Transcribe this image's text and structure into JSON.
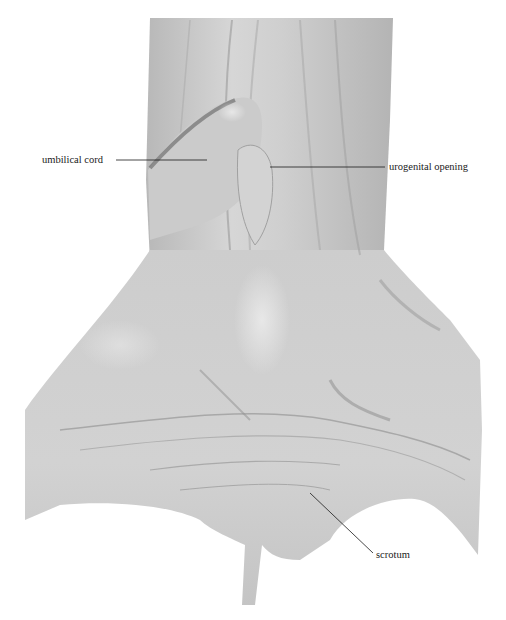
{
  "figure": {
    "background": "#ffffff",
    "specimen_tone": "#c9c9c9",
    "labels": [
      {
        "id": "umbilical-cord",
        "text": "umbilical cord",
        "x": 42,
        "y": 154,
        "line": {
          "x1": 116,
          "y1": 160,
          "x2": 207,
          "y2": 160
        }
      },
      {
        "id": "urogenital-opening",
        "text": "urogenital opening",
        "x": 389,
        "y": 161,
        "line": {
          "x1": 270,
          "y1": 167,
          "x2": 385,
          "y2": 167
        }
      },
      {
        "id": "scrotum",
        "text": "scrotum",
        "x": 376,
        "y": 549,
        "line": {
          "x1": 310,
          "y1": 493,
          "x2": 373,
          "y2": 553
        }
      }
    ]
  }
}
